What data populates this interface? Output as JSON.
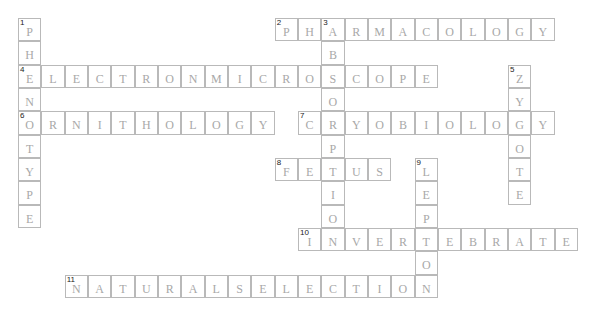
{
  "puzzle": {
    "cell_size": 23.33,
    "origin_x": 18,
    "origin_y": 18,
    "colors": {
      "border": "#b9b9b9",
      "letter": "#a8a8a8",
      "number": "#222222"
    },
    "words": [
      {
        "number": "1",
        "direction": "down",
        "row": 0,
        "col": 0,
        "answer": "PHENOTYPE"
      },
      {
        "number": "2",
        "direction": "across",
        "row": 0,
        "col": 11,
        "answer": "PHARMACOLOGY"
      },
      {
        "number": "3",
        "direction": "down",
        "row": 0,
        "col": 13,
        "answer": "ABSORPTION"
      },
      {
        "number": "4",
        "direction": "across",
        "row": 2,
        "col": 0,
        "answer": "ELECTRONMICROSCOPE"
      },
      {
        "number": "5",
        "direction": "down",
        "row": 2,
        "col": 21,
        "answer": "ZYGOTE"
      },
      {
        "number": "6",
        "direction": "across",
        "row": 4,
        "col": 0,
        "answer": "ORNITHOLOGY"
      },
      {
        "number": "7",
        "direction": "across",
        "row": 4,
        "col": 12,
        "answer": "CRYOBIOLOGY"
      },
      {
        "number": "8",
        "direction": "across",
        "row": 6,
        "col": 11,
        "answer": "FETUS"
      },
      {
        "number": "9",
        "direction": "down",
        "row": 6,
        "col": 17,
        "answer": "LEPTON"
      },
      {
        "number": "10",
        "direction": "across",
        "row": 9,
        "col": 12,
        "answer": "INVERTEBRATE"
      },
      {
        "number": "11",
        "direction": "across",
        "row": 11,
        "col": 2,
        "answer": "NATURALSELECTION"
      }
    ]
  }
}
